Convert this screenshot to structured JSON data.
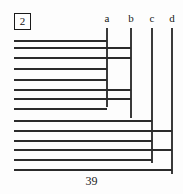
{
  "figure": {
    "index_label": "2",
    "caption": "39",
    "left_margin_x": 14,
    "ink_color": "#2b2b2b",
    "rule_color": "#3a3a3a"
  },
  "columns": [
    {
      "label": "a",
      "x": 107,
      "rule_top": 28,
      "rule_bottom": 107
    },
    {
      "label": "b",
      "x": 131,
      "rule_top": 28,
      "rule_bottom": 118
    },
    {
      "label": "c",
      "x": 152,
      "rule_top": 28,
      "rule_bottom": 163
    },
    {
      "label": "d",
      "x": 172,
      "rule_top": 28,
      "rule_bottom": 174
    }
  ],
  "chart_data": {
    "type": "bar",
    "title": "",
    "subtitle": "",
    "xlabel": "",
    "ylabel": "",
    "orientation": "horizontal",
    "categories": [
      "1",
      "2",
      "3",
      "4",
      "5",
      "6",
      "7",
      "8",
      "9",
      "10",
      "11",
      "12",
      "13"
    ],
    "column_labels": [
      "a",
      "b",
      "c",
      "d"
    ],
    "column_x": [
      107,
      131,
      152,
      172
    ],
    "origin_x": 14,
    "values": [
      107,
      131,
      131,
      107,
      107,
      131,
      131,
      107,
      152,
      172,
      152,
      152,
      172
    ],
    "bars": [
      {
        "index": 1,
        "y": 40,
        "x_start": 14,
        "x_end": 107,
        "ends_at": "a"
      },
      {
        "index": 2,
        "y": 47,
        "x_start": 14,
        "x_end": 131,
        "ends_at": "b"
      },
      {
        "index": 3,
        "y": 57,
        "x_start": 14,
        "x_end": 131,
        "ends_at": "b"
      },
      {
        "index": 4,
        "y": 68,
        "x_start": 14,
        "x_end": 107,
        "ends_at": "a"
      },
      {
        "index": 5,
        "y": 79,
        "x_start": 14,
        "x_end": 107,
        "ends_at": "a"
      },
      {
        "index": 6,
        "y": 89,
        "x_start": 14,
        "x_end": 131,
        "ends_at": "b"
      },
      {
        "index": 7,
        "y": 98,
        "x_start": 14,
        "x_end": 131,
        "ends_at": "b"
      },
      {
        "index": 8,
        "y": 108,
        "x_start": 14,
        "x_end": 107,
        "ends_at": "a"
      },
      {
        "index": 9,
        "y": 120,
        "x_start": 14,
        "x_end": 152,
        "ends_at": "c"
      },
      {
        "index": 10,
        "y": 130,
        "x_start": 14,
        "x_end": 172,
        "ends_at": "d"
      },
      {
        "index": 11,
        "y": 140,
        "x_start": 14,
        "x_end": 152,
        "ends_at": "c"
      },
      {
        "index": 12,
        "y": 149,
        "x_start": 14,
        "x_end": 172,
        "ends_at": "d"
      },
      {
        "index": 13,
        "y": 159,
        "x_start": 14,
        "x_end": 152,
        "ends_at": "c"
      },
      {
        "index": 14,
        "y": 169,
        "x_start": 14,
        "x_end": 172,
        "ends_at": "d"
      }
    ],
    "ylim": [
      0,
      194
    ],
    "xlim": [
      0,
      183
    ],
    "grid": false,
    "legend": "none"
  }
}
